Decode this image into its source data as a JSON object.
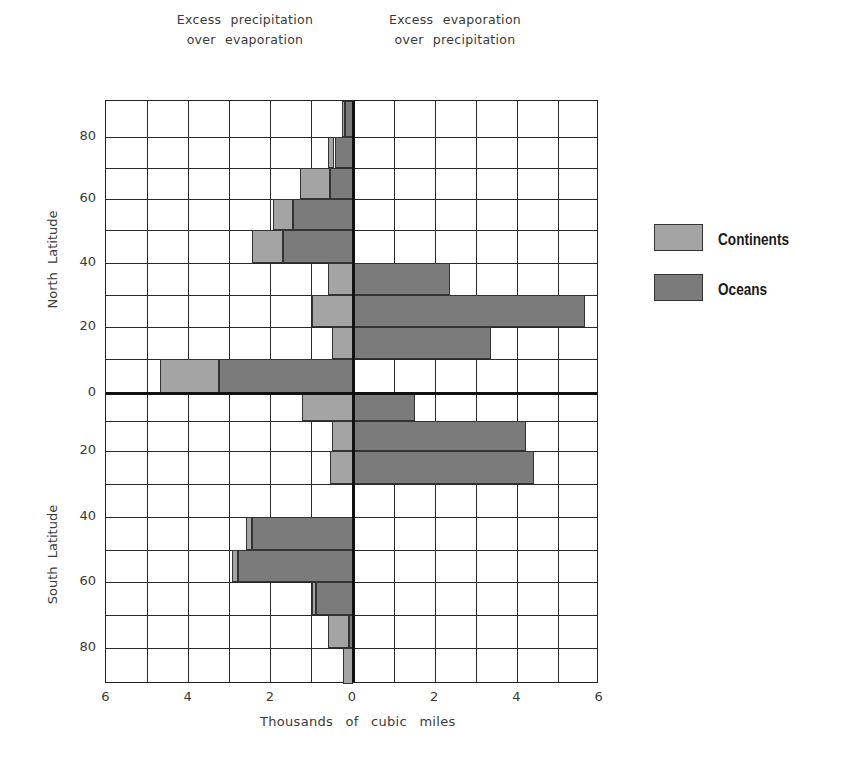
{
  "chart_data": {
    "type": "bar",
    "orientation": "horizontal",
    "stacked": true,
    "title": "",
    "header_left": [
      "Excess precipitation",
      "over evaporation"
    ],
    "header_right": [
      "Excess evaporation",
      "over precipitation"
    ],
    "xlabel": "Thousands of cubic miles",
    "ylabel_north": "North Latitude",
    "ylabel_south": "South Latitude",
    "xlim": [
      -6,
      6
    ],
    "x_tick_labels": [
      "6",
      "4",
      "2",
      "0",
      "2",
      "4",
      "6"
    ],
    "y_tick_labels_north": [
      "80",
      "60",
      "40",
      "20",
      "0"
    ],
    "y_tick_labels_south": [
      "20",
      "40",
      "60",
      "80"
    ],
    "grid": true,
    "legend_position": "right",
    "legend": [
      {
        "name": "Continents",
        "color": "#a4a4a4"
      },
      {
        "name": "Oceans",
        "color": "#7b7b7b"
      }
    ],
    "categories": [
      "90-80N",
      "80-70N",
      "70-60N",
      "60-50N",
      "50-40N",
      "40-30N",
      "30-20N",
      "20-10N",
      "10-0N",
      "0-10S",
      "10-20S",
      "20-30S",
      "30-40S",
      "40-50S",
      "50-60S",
      "60-70S",
      "70-80S",
      "80-90S"
    ],
    "series": [
      {
        "name": "Oceans",
        "values": [
          -0.2,
          -0.45,
          -0.55,
          -1.45,
          -1.7,
          2.35,
          5.65,
          3.35,
          -3.25,
          1.5,
          4.2,
          4.4,
          0,
          -2.45,
          -2.8,
          -0.9,
          -0.1,
          0
        ]
      },
      {
        "name": "Continents",
        "values": [
          -0.07,
          -0.15,
          -0.75,
          -0.5,
          -0.75,
          -0.6,
          -1.0,
          -0.5,
          -1.45,
          -1.25,
          -0.5,
          -0.55,
          0,
          -0.15,
          -0.15,
          -0.1,
          -0.5,
          -0.25
        ]
      }
    ]
  },
  "legend": {
    "continents": "Continents",
    "oceans": "Oceans"
  }
}
